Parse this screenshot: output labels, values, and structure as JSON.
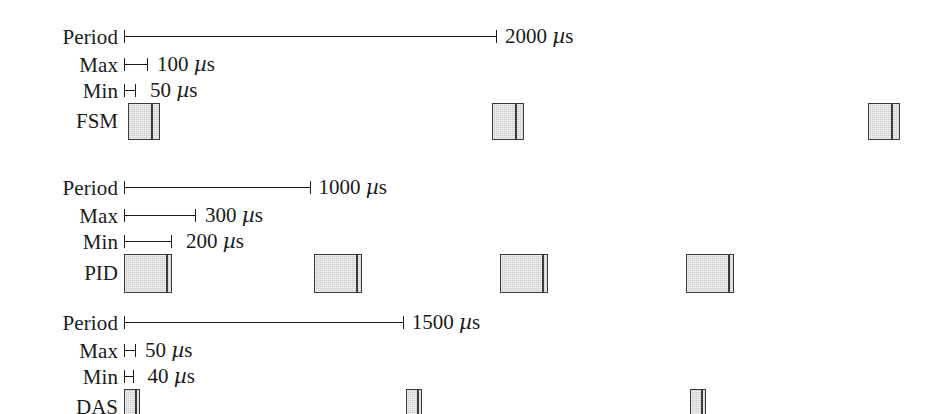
{
  "figure": {
    "type": "timing-diagram",
    "title": "",
    "unit": "µs",
    "timeline": {
      "origin_px": 124,
      "px_per_us": 0.1865
    },
    "rows": [
      {
        "id": "fsm",
        "task_label": "FSM",
        "period_label": "Period",
        "period_value": "2000 µs",
        "period_us": 2000,
        "max_label": "Max",
        "max_value": "100 µs",
        "max_us": 100,
        "min_label": "Min",
        "min_value": "50 µs",
        "min_us": 50,
        "blocks": [
          {
            "x": 128,
            "w": 32,
            "divider": 22
          },
          {
            "x": 492,
            "w": 32,
            "divider": 22
          },
          {
            "x": 868,
            "w": 32,
            "divider": 22
          }
        ]
      },
      {
        "id": "pid",
        "task_label": "PID",
        "period_label": "Period",
        "period_value": "1000 µs",
        "period_us": 1000,
        "max_label": "Max",
        "max_value": "300 µs",
        "max_us": 300,
        "min_label": "Min",
        "min_value": "200 µs",
        "min_us": 200,
        "blocks": [
          {
            "x": 124,
            "w": 48,
            "divider": 41
          },
          {
            "x": 314,
            "w": 48,
            "divider": 41
          },
          {
            "x": 500,
            "w": 48,
            "divider": 41
          },
          {
            "x": 686,
            "w": 48,
            "divider": 41
          }
        ]
      },
      {
        "id": "das",
        "task_label": "DAS",
        "period_label": "Period",
        "period_value": "1500 µs",
        "period_us": 1500,
        "max_label": "Max",
        "max_value": "50 µs",
        "max_us": 50,
        "min_label": "Min",
        "min_value": "40 µs",
        "min_us": 40,
        "blocks": [
          {
            "x": 124,
            "w": 16,
            "divider": 10
          },
          {
            "x": 406,
            "w": 16,
            "divider": 10
          },
          {
            "x": 690,
            "w": 16,
            "divider": 10
          }
        ]
      }
    ],
    "colors": {
      "ink": "#1a1a1a",
      "block_fill": "#cfcfcf",
      "block_stroke": "#3a3a3a",
      "background": "#ffffff"
    }
  }
}
